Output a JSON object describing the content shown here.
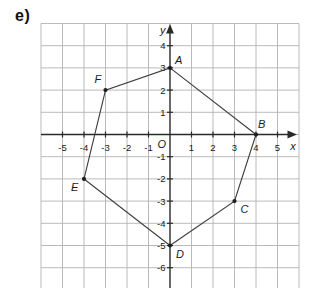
{
  "figure_label": "e)",
  "chart_data": {
    "type": "scatter",
    "title": "",
    "xlabel": "x",
    "ylabel": "y",
    "origin_label": "O",
    "grid": true,
    "xlim": [
      -6,
      6
    ],
    "ylim": [
      -6,
      5
    ],
    "x_ticks": [
      -5,
      -4,
      -3,
      -2,
      -1,
      1,
      2,
      3,
      4,
      5
    ],
    "y_ticks": [
      4,
      3,
      2,
      1,
      -1,
      -2,
      -3,
      -4,
      -5,
      -6
    ],
    "points": [
      {
        "label": "A",
        "x": 0,
        "y": 3,
        "label_offset": [
          5,
          -4
        ]
      },
      {
        "label": "B",
        "x": 4,
        "y": 0,
        "label_offset": [
          2,
          -7
        ]
      },
      {
        "label": "C",
        "x": 3,
        "y": -3,
        "label_offset": [
          6,
          12
        ]
      },
      {
        "label": "D",
        "x": 0,
        "y": -5,
        "label_offset": [
          6,
          12
        ]
      },
      {
        "label": "E",
        "x": -4,
        "y": -2,
        "label_offset": [
          -13,
          12
        ]
      },
      {
        "label": "F",
        "x": -3,
        "y": 2,
        "label_offset": [
          -11,
          -7
        ]
      }
    ],
    "polygon_order": [
      "A",
      "B",
      "C",
      "D",
      "E",
      "F"
    ],
    "colors": {
      "background": "#ffffff",
      "grid_line": "#b2b2b2",
      "axis": "#2a2a2a",
      "shape_outline": "#3f3f3f",
      "point_marker": "#1f1f1f",
      "label_text": "#1a1a1a"
    }
  }
}
